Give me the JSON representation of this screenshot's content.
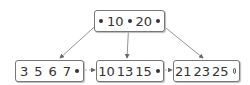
{
  "diagram": {
    "type": "B+ tree",
    "root": {
      "keys": [
        "10",
        "20"
      ]
    },
    "leaves": [
      {
        "keys": [
          "3",
          "5",
          "6",
          "7"
        ],
        "next": "filled"
      },
      {
        "keys": [
          "10",
          "13",
          "15"
        ],
        "next": "filled"
      },
      {
        "keys": [
          "21",
          "23",
          "25"
        ],
        "next": "null"
      }
    ]
  }
}
